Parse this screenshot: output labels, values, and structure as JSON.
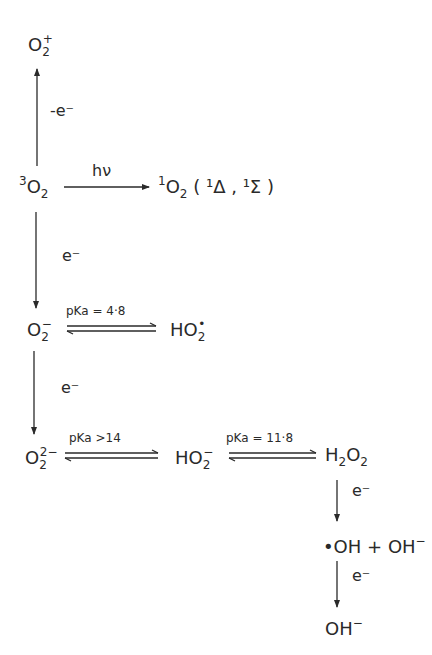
{
  "species": {
    "o2_cation": {
      "base": "O",
      "sub": "2",
      "sup": "+"
    },
    "triplet_o2": {
      "pre": "3",
      "base": "O",
      "sub": "2"
    },
    "singlet_o2": {
      "pre": "1",
      "base": "O",
      "sub": "2",
      "states": "( ¹Δ , ¹Σ )"
    },
    "superoxide": {
      "base": "O",
      "sub": "2",
      "sup": "−"
    },
    "hydroperoxyl": {
      "base": "HO",
      "sub": "2",
      "sup": "•"
    },
    "peroxide": {
      "base": "O",
      "sub": "2",
      "sup": "2−"
    },
    "hydroperoxide_anion": {
      "base": "HO",
      "sub": "2",
      "sup": "−"
    },
    "hydrogen_peroxide": {
      "h": "H",
      "h_sub": "2",
      "o": "O",
      "o_sub": "2"
    },
    "hydroxyl_radical_plus_hydroxide": {
      "radical": "•OH",
      "plus": "+",
      "anion": "OH",
      "anion_sup": "−"
    },
    "hydroxide": {
      "base": "OH",
      "sup": "−"
    }
  },
  "conditions": {
    "oxidation": "-e⁻",
    "photon": "hν",
    "reduction_1": "e⁻",
    "pka_1": "pKa = 4·8",
    "reduction_2": "e⁻",
    "pka_2": "pKa >14",
    "pka_3": "pKa = 11·8",
    "reduction_3": "e⁻",
    "reduction_4": "e⁻"
  },
  "colors": {
    "ink": "#2a2a2a",
    "background": "#ffffff"
  }
}
